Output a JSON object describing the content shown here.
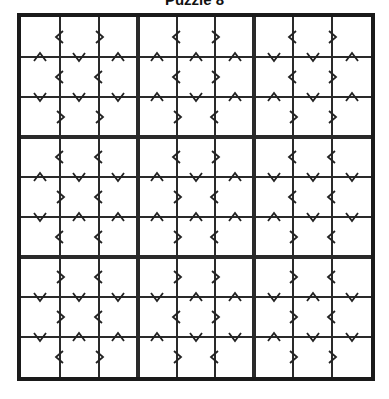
{
  "title": "Puzzle 8",
  "grid": {
    "size": 9,
    "block_size": 3,
    "blocks": [
      [
        {
          "h": [
            [
              "<",
              ">"
            ],
            [
              "<",
              "<"
            ],
            [
              ">",
              ">"
            ]
          ],
          "v": [
            [
              "^",
              "v",
              "^"
            ],
            [
              "v",
              "v",
              "v"
            ]
          ]
        },
        {
          "h": [
            [
              "<",
              ">"
            ],
            [
              "<",
              ">"
            ],
            [
              ">",
              "<"
            ]
          ],
          "v": [
            [
              "^",
              "^",
              "^"
            ],
            [
              "^",
              "v",
              "^"
            ]
          ]
        },
        {
          "h": [
            [
              "<",
              ">"
            ],
            [
              "<",
              ">"
            ],
            [
              ">",
              ">"
            ]
          ],
          "v": [
            [
              "v",
              "v",
              "^"
            ],
            [
              "^",
              "v",
              "^"
            ]
          ]
        }
      ],
      [
        {
          "h": [
            [
              "<",
              "<"
            ],
            [
              ">",
              "<"
            ],
            [
              "<",
              "<"
            ]
          ],
          "v": [
            [
              "^",
              "v",
              "v"
            ],
            [
              "v",
              "^",
              "^"
            ]
          ]
        },
        {
          "h": [
            [
              "<",
              ">"
            ],
            [
              ">",
              "<"
            ],
            [
              ">",
              "<"
            ]
          ],
          "v": [
            [
              "^",
              "v",
              "^"
            ],
            [
              "^",
              "^",
              "^"
            ]
          ]
        },
        {
          "h": [
            [
              "<",
              "<"
            ],
            [
              "<",
              "<"
            ],
            [
              ">",
              "<"
            ]
          ],
          "v": [
            [
              "v",
              "v",
              "v"
            ],
            [
              "^",
              "v",
              "v"
            ]
          ]
        }
      ],
      [
        {
          "h": [
            [
              ">",
              "<"
            ],
            [
              ">",
              "<"
            ],
            [
              "<",
              ">"
            ]
          ],
          "v": [
            [
              "v",
              "v",
              "v"
            ],
            [
              "v",
              "^",
              "^"
            ]
          ]
        },
        {
          "h": [
            [
              ">",
              ">"
            ],
            [
              "<",
              ">"
            ],
            [
              ">",
              "<"
            ]
          ],
          "v": [
            [
              "v",
              "^",
              "^"
            ],
            [
              "^",
              "v",
              "v"
            ]
          ]
        },
        {
          "h": [
            [
              ">",
              "<"
            ],
            [
              ">",
              "<"
            ],
            [
              ">",
              ">"
            ]
          ],
          "v": [
            [
              "v",
              "^",
              "v"
            ],
            [
              "^",
              "v",
              "v"
            ]
          ]
        }
      ]
    ],
    "cells": []
  },
  "colors": {
    "line": "#2a2a2a",
    "border": "#1a1a1a",
    "background": "#ffffff"
  }
}
